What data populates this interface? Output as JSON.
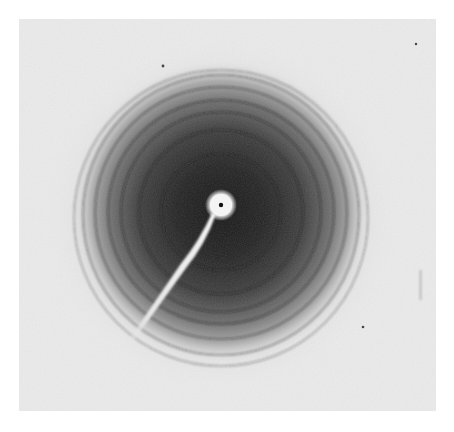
{
  "image": {
    "subject": "X-ray fiber diffraction pattern",
    "description": "Concentric diffraction rings around a central beam stop with holder arm extending to lower left",
    "width": 454,
    "height": 432
  },
  "panel": {
    "x": 19,
    "y": 19,
    "width": 417,
    "height": 392,
    "color": "#ececec"
  },
  "halo": {
    "cx": 221,
    "cy": 212,
    "rx": 150,
    "ry": 152,
    "core_color": "#1e1e1e",
    "mid_color": "#555555",
    "edge_color": "#ececec"
  },
  "beam_stop": {
    "cx": 221,
    "cy": 205,
    "r": 11,
    "glow_r": 15,
    "center_dot_r": 2.2,
    "color": "#f4f4f4"
  },
  "holder_arm": {
    "x1": 216,
    "y1": 215,
    "x2": 130,
    "y2": 346,
    "color": "#e8e8e8"
  },
  "rings": [
    {
      "cx": 221,
      "cy": 212,
      "rx": 60,
      "ry": 58,
      "opacity": 0.35
    },
    {
      "cx": 221,
      "cy": 212,
      "rx": 82,
      "ry": 82,
      "opacity": 0.35
    },
    {
      "cx": 221,
      "cy": 212,
      "rx": 100,
      "ry": 100,
      "opacity": 0.4
    },
    {
      "cx": 221,
      "cy": 212,
      "rx": 113,
      "ry": 112,
      "opacity": 0.4
    },
    {
      "cx": 221,
      "cy": 213,
      "rx": 126,
      "ry": 126,
      "opacity": 0.38
    },
    {
      "cx": 221,
      "cy": 215,
      "rx": 138,
      "ry": 140,
      "opacity": 0.32
    },
    {
      "cx": 221,
      "cy": 218,
      "rx": 147,
      "ry": 148,
      "opacity": 0.25
    }
  ],
  "specks": [
    {
      "x": 163,
      "y": 66,
      "r": 1.4
    },
    {
      "x": 416,
      "y": 44,
      "r": 1.2
    },
    {
      "x": 363,
      "y": 327,
      "r": 1.3
    }
  ],
  "smudge": {
    "x": 420,
    "y": 285,
    "w": 3,
    "h": 30
  }
}
